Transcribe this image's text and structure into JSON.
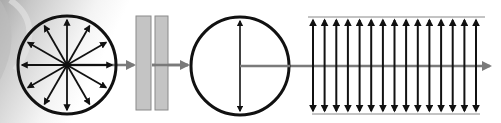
{
  "diagram": {
    "colors": {
      "stroke": "#111111",
      "beam": "#7a7a7a",
      "plate_fill": "#c4c4c4",
      "plate_stroke": "#8a8a8a",
      "background_left": "#b8b8b8",
      "background": "#ffffff"
    },
    "stages": [
      {
        "name": "unpolarized-light",
        "shape": "circle",
        "spokes": 12,
        "center": [
          67,
          65
        ],
        "radius": 49
      },
      {
        "name": "polarizer",
        "shape": "plates",
        "count": 2
      },
      {
        "name": "polarized-light",
        "shape": "circle",
        "axis": "vertical",
        "center": [
          240,
          66
        ],
        "radius": 50
      },
      {
        "name": "polarized-wave-field",
        "shape": "arrow-array",
        "arrow_count": 15,
        "orientation": "vertical"
      }
    ]
  }
}
